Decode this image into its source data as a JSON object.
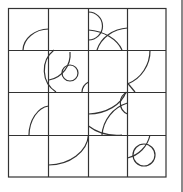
{
  "puzzle": {
    "type": "tile-grid",
    "rows": 4,
    "cols": 4,
    "line_color": "#333333",
    "background": "#ffffff"
  }
}
